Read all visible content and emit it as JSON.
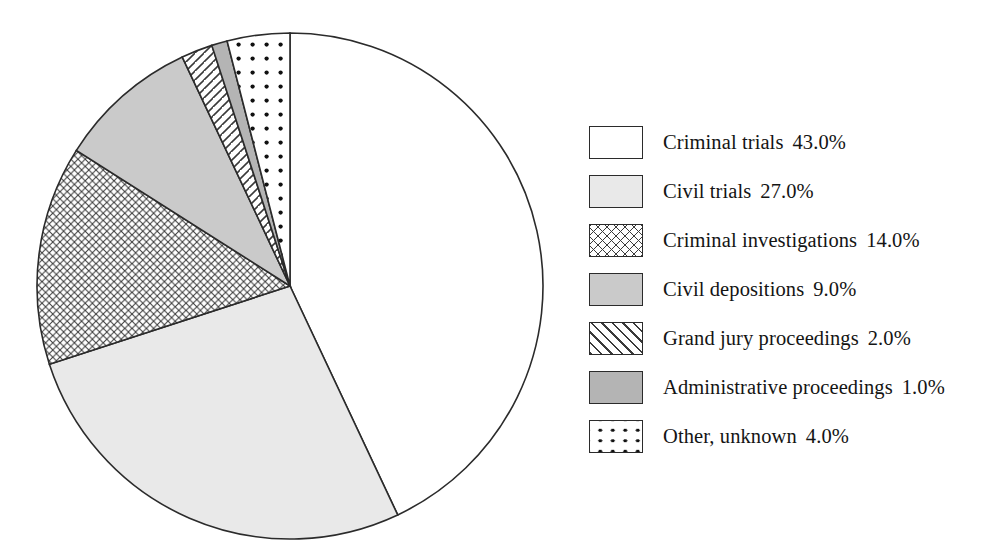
{
  "chart_data": {
    "type": "pie",
    "title": "",
    "subtitle": "",
    "xlabel": "",
    "ylabel": "",
    "legend_position": "right",
    "grid": false,
    "units": "percent",
    "start_angle_deg": 0,
    "direction": "clockwise",
    "categories": [
      "Criminal trials",
      "Civil trials",
      "Criminal investigations",
      "Civil depositions",
      "Grand jury proceedings",
      "Administrative proceedings",
      "Other, unknown"
    ],
    "values": [
      43.0,
      27.0,
      14.0,
      9.0,
      2.0,
      1.0,
      4.0
    ],
    "value_labels": [
      "43.0%",
      "27.0%",
      "14.0%",
      "9.0%",
      "2.0%",
      "1.0%",
      "4.0%"
    ],
    "slices": [
      {
        "label": "Criminal trials",
        "value": 43.0,
        "value_label": "43.0%",
        "fill_style": "solid",
        "fill_color": "#ffffff",
        "stroke_color": "#2b2b2b"
      },
      {
        "label": "Civil trials",
        "value": 27.0,
        "value_label": "27.0%",
        "fill_style": "solid",
        "fill_color": "#e9e9e9",
        "stroke_color": "#2b2b2b"
      },
      {
        "label": "Criminal investigations",
        "value": 14.0,
        "value_label": "14.0%",
        "fill_style": "crosshatch",
        "fill_color": "#ffffff",
        "stroke_color": "#2b2b2b"
      },
      {
        "label": "Civil depositions",
        "value": 9.0,
        "value_label": "9.0%",
        "fill_style": "solid",
        "fill_color": "#cacaca",
        "stroke_color": "#2b2b2b"
      },
      {
        "label": "Grand jury proceedings",
        "value": 2.0,
        "value_label": "2.0%",
        "fill_style": "diagonal-hatch",
        "fill_color": "#ffffff",
        "stroke_color": "#2b2b2b"
      },
      {
        "label": "Administrative proceedings",
        "value": 1.0,
        "value_label": "1.0%",
        "fill_style": "solid",
        "fill_color": "#b4b4b4",
        "stroke_color": "#2b2b2b"
      },
      {
        "label": "Other, unknown",
        "value": 4.0,
        "value_label": "4.0%",
        "fill_style": "dots",
        "fill_color": "#ffffff",
        "stroke_color": "#2b2b2b"
      }
    ]
  },
  "legend": {
    "items": [
      {
        "label": "Criminal trials",
        "value_label": "43.0%",
        "swatch": "swatch-white"
      },
      {
        "label": "Civil trials",
        "value_label": "27.0%",
        "swatch": "swatch-light-gray"
      },
      {
        "label": "Criminal investigations",
        "value_label": "14.0%",
        "swatch": "swatch-crosshatch"
      },
      {
        "label": "Civil depositions",
        "value_label": "9.0%",
        "swatch": "swatch-medium-gray"
      },
      {
        "label": "Grand jury proceedings",
        "value_label": "2.0%",
        "swatch": "swatch-diagonal-hatch"
      },
      {
        "label": "Administrative proceedings",
        "value_label": "1.0%",
        "swatch": "swatch-dark-gray"
      },
      {
        "label": "Other, unknown",
        "value_label": "4.0%",
        "swatch": "swatch-dots"
      }
    ]
  },
  "colors": {
    "outline": "#2b2b2b",
    "background": "#ffffff",
    "light_gray": "#e9e9e9",
    "medium_gray": "#cacaca",
    "dark_gray": "#b4b4b4",
    "dot": "#111111"
  }
}
